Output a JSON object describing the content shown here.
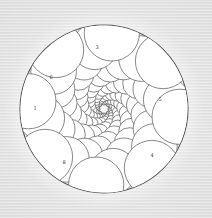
{
  "figure": {
    "width": 212,
    "height": 218,
    "background": "#ececec",
    "stroke_color": "#555555",
    "fill_color": "#ffffff",
    "outer_circle": {
      "cx": 104,
      "cy": 109,
      "r": 84
    },
    "spiral": {
      "cx": 104,
      "cy": 109,
      "arms": 8,
      "growth": 1.18,
      "twist_deg": 26,
      "start_r": 4,
      "rings": 14
    }
  },
  "labels": [
    {
      "text": "3",
      "x": 97,
      "y": 47
    },
    {
      "text": "6",
      "x": 51,
      "y": 77
    },
    {
      "text": "5",
      "x": 160,
      "y": 99
    },
    {
      "text": "1",
      "x": 35,
      "y": 108
    },
    {
      "text": "4",
      "x": 152,
      "y": 155
    },
    {
      "text": "8",
      "x": 64,
      "y": 162
    }
  ]
}
